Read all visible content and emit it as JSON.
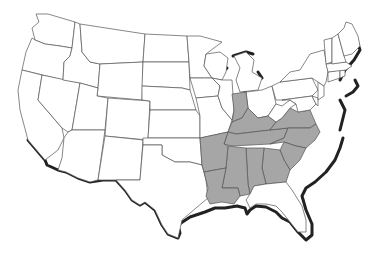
{
  "map": {
    "title": "",
    "region": "Contiguous United States",
    "colors": {
      "highlighted": "#a6a6a6",
      "default": "#ffffff",
      "border": "#555555",
      "coast_shadow": "#222222"
    },
    "highlighted_states": [
      "Indiana",
      "Kentucky",
      "Tennessee",
      "Virginia",
      "North Carolina",
      "South Carolina",
      "Georgia",
      "Alabama",
      "Mississippi",
      "Arkansas",
      "Louisiana"
    ],
    "states": [
      {
        "id": "WA",
        "fill": "default"
      },
      {
        "id": "OR",
        "fill": "default"
      },
      {
        "id": "CA",
        "fill": "default"
      },
      {
        "id": "ID",
        "fill": "default"
      },
      {
        "id": "NV",
        "fill": "default"
      },
      {
        "id": "MT",
        "fill": "default"
      },
      {
        "id": "WY",
        "fill": "default"
      },
      {
        "id": "UT",
        "fill": "default"
      },
      {
        "id": "AZ",
        "fill": "default"
      },
      {
        "id": "CO",
        "fill": "default"
      },
      {
        "id": "NM",
        "fill": "default"
      },
      {
        "id": "ND",
        "fill": "default"
      },
      {
        "id": "SD",
        "fill": "default"
      },
      {
        "id": "NE",
        "fill": "default"
      },
      {
        "id": "KS",
        "fill": "default"
      },
      {
        "id": "OK",
        "fill": "default"
      },
      {
        "id": "TX",
        "fill": "default"
      },
      {
        "id": "MN",
        "fill": "default"
      },
      {
        "id": "IA",
        "fill": "default"
      },
      {
        "id": "MO",
        "fill": "default"
      },
      {
        "id": "AR",
        "fill": "highlighted"
      },
      {
        "id": "LA",
        "fill": "highlighted"
      },
      {
        "id": "WI",
        "fill": "default"
      },
      {
        "id": "IL",
        "fill": "default"
      },
      {
        "id": "MI",
        "fill": "default"
      },
      {
        "id": "IN",
        "fill": "highlighted"
      },
      {
        "id": "OH",
        "fill": "default"
      },
      {
        "id": "KY",
        "fill": "highlighted"
      },
      {
        "id": "TN",
        "fill": "highlighted"
      },
      {
        "id": "MS",
        "fill": "highlighted"
      },
      {
        "id": "AL",
        "fill": "highlighted"
      },
      {
        "id": "GA",
        "fill": "highlighted"
      },
      {
        "id": "FL",
        "fill": "default"
      },
      {
        "id": "SC",
        "fill": "highlighted"
      },
      {
        "id": "NC",
        "fill": "highlighted"
      },
      {
        "id": "VA",
        "fill": "highlighted"
      },
      {
        "id": "WV",
        "fill": "default"
      },
      {
        "id": "PA",
        "fill": "default"
      },
      {
        "id": "NY",
        "fill": "default"
      },
      {
        "id": "MD",
        "fill": "default"
      },
      {
        "id": "DE",
        "fill": "default"
      },
      {
        "id": "NJ",
        "fill": "default"
      },
      {
        "id": "CT",
        "fill": "default"
      },
      {
        "id": "RI",
        "fill": "default"
      },
      {
        "id": "MA",
        "fill": "default"
      },
      {
        "id": "VT",
        "fill": "default"
      },
      {
        "id": "NH",
        "fill": "default"
      },
      {
        "id": "ME",
        "fill": "default"
      }
    ]
  }
}
